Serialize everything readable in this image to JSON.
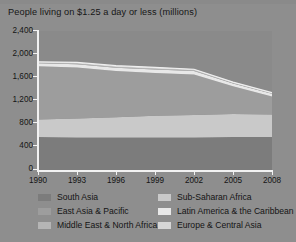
{
  "chart_data": {
    "type": "area",
    "title": "People living on $1.25 a day or less (millions)",
    "xlabel": "",
    "ylabel": "",
    "stacked": true,
    "grid": false,
    "legend_position": "bottom",
    "xlim": [
      1990,
      2008
    ],
    "ylim": [
      0,
      2400
    ],
    "yticks": [
      0,
      400,
      800,
      1200,
      1600,
      2000,
      2400
    ],
    "ytick_labels": [
      "0",
      "400",
      "800",
      "1,200",
      "1,600",
      "2,000",
      "2,400"
    ],
    "xticks": [
      1990,
      1993,
      1996,
      1999,
      2002,
      2005,
      2008
    ],
    "xtick_labels": [
      "1990",
      "1993",
      "1996",
      "1999",
      "2002",
      "2005",
      "2008"
    ],
    "x": [
      1990,
      1993,
      1996,
      1999,
      2002,
      2005,
      2008
    ],
    "series": [
      {
        "name": "South Asia",
        "color": "#7c7c7c",
        "values": [
          570,
          560,
          560,
          560,
          560,
          570,
          570
        ]
      },
      {
        "name": "Sub-Saharan Africa",
        "color": "#c9c9c9",
        "values": [
          300,
          330,
          350,
          375,
          390,
          395,
          390
        ]
      },
      {
        "name": "East Asia & Pacific",
        "color": "#9d9d9d",
        "values": [
          920,
          880,
          800,
          740,
          700,
          480,
          310
        ]
      },
      {
        "name": "Latin America & the Caribbean",
        "color": "#e8e8e8",
        "values": [
          55,
          55,
          55,
          60,
          60,
          50,
          45
        ]
      },
      {
        "name": "Middle East & North Africa",
        "color": "#b5b5b5",
        "values": [
          12,
          12,
          12,
          12,
          12,
          11,
          10
        ]
      },
      {
        "name": "Europe & Central Asia",
        "color": "#d6d6d6",
        "values": [
          10,
          20,
          25,
          25,
          18,
          12,
          10
        ]
      }
    ],
    "totals": [
      1867,
      1857,
      1802,
      1772,
      1740,
      1518,
      1335
    ]
  },
  "legend": {
    "left_column": [
      {
        "label": "South Asia",
        "color": "#7c7c7c"
      },
      {
        "label": "East Asia & Pacific",
        "color": "#9d9d9d"
      },
      {
        "label": "Middle East & North Africa",
        "color": "#b5b5b5"
      }
    ],
    "right_column": [
      {
        "label": "Sub-Saharan Africa",
        "color": "#c9c9c9"
      },
      {
        "label": "Latin America & the Caribbean",
        "color": "#e8e8e8"
      },
      {
        "label": "Europe & Central Asia",
        "color": "#d6d6d6"
      }
    ]
  },
  "style": {
    "background": "#8e8e8e",
    "plot_background": "#8a8a8a",
    "axis_color": "#f2f2f2",
    "text_color": "#151515"
  }
}
